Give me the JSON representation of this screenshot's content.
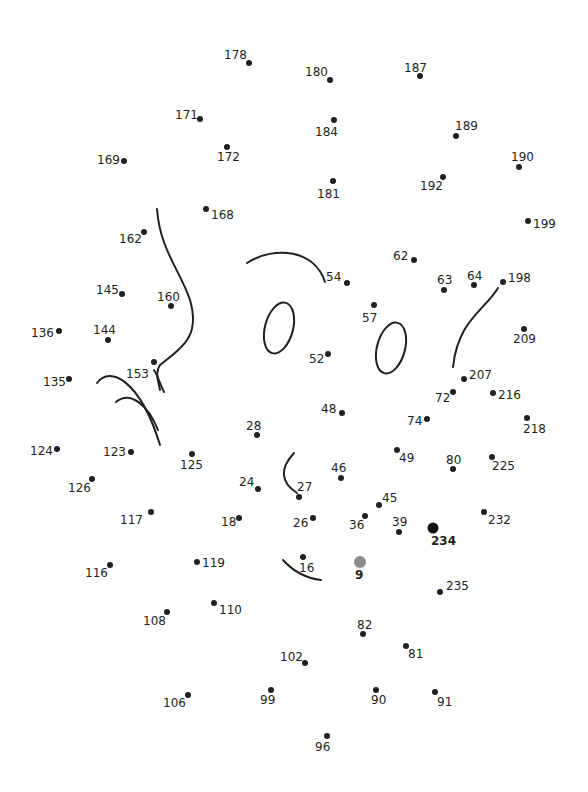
{
  "puzzle": {
    "type": "connect-the-dots",
    "colors": {
      "dot": "#231f20",
      "start_dot": "#8c8c8c",
      "end_dot": "#111111",
      "background": "#ffffff"
    },
    "start_number": "9",
    "end_number": "234",
    "dots": [
      {
        "n": "178",
        "x": 249,
        "y": 63,
        "lx": 224,
        "ly": 49
      },
      {
        "n": "180",
        "x": 330,
        "y": 80,
        "lx": 305,
        "ly": 66
      },
      {
        "n": "187",
        "x": 420,
        "y": 76,
        "lx": 404,
        "ly": 62
      },
      {
        "n": "171",
        "x": 200,
        "y": 119,
        "lx": 175,
        "ly": 109
      },
      {
        "n": "184",
        "x": 334,
        "y": 120,
        "lx": 315,
        "ly": 126
      },
      {
        "n": "189",
        "x": 456,
        "y": 136,
        "lx": 455,
        "ly": 120
      },
      {
        "n": "172",
        "x": 227,
        "y": 147,
        "lx": 217,
        "ly": 151
      },
      {
        "n": "169",
        "x": 124,
        "y": 161,
        "lx": 97,
        "ly": 154
      },
      {
        "n": "190",
        "x": 519,
        "y": 167,
        "lx": 511,
        "ly": 151
      },
      {
        "n": "181",
        "x": 333,
        "y": 181,
        "lx": 317,
        "ly": 188
      },
      {
        "n": "192",
        "x": 443,
        "y": 177,
        "lx": 420,
        "ly": 180
      },
      {
        "n": "168",
        "x": 206,
        "y": 209,
        "lx": 211,
        "ly": 209
      },
      {
        "n": "199",
        "x": 528,
        "y": 221,
        "lx": 533,
        "ly": 218
      },
      {
        "n": "162",
        "x": 144,
        "y": 232,
        "lx": 119,
        "ly": 233
      },
      {
        "n": "62",
        "x": 414,
        "y": 260,
        "lx": 393,
        "ly": 250
      },
      {
        "n": "54",
        "x": 347,
        "y": 283,
        "lx": 326,
        "ly": 271
      },
      {
        "n": "63",
        "x": 444,
        "y": 290,
        "lx": 437,
        "ly": 274
      },
      {
        "n": "64",
        "x": 474,
        "y": 285,
        "lx": 467,
        "ly": 270
      },
      {
        "n": "198",
        "x": 503,
        "y": 282,
        "lx": 508,
        "ly": 272
      },
      {
        "n": "145",
        "x": 122,
        "y": 294,
        "lx": 96,
        "ly": 284
      },
      {
        "n": "160",
        "x": 171,
        "y": 306,
        "lx": 157,
        "ly": 291
      },
      {
        "n": "57",
        "x": 374,
        "y": 305,
        "lx": 362,
        "ly": 312
      },
      {
        "n": "136",
        "x": 59,
        "y": 331,
        "lx": 31,
        "ly": 327
      },
      {
        "n": "144",
        "x": 108,
        "y": 340,
        "lx": 93,
        "ly": 324
      },
      {
        "n": "209",
        "x": 524,
        "y": 329,
        "lx": 513,
        "ly": 333
      },
      {
        "n": "52",
        "x": 328,
        "y": 354,
        "lx": 309,
        "ly": 353
      },
      {
        "n": "153",
        "x": 154,
        "y": 362,
        "lx": 126,
        "ly": 368
      },
      {
        "n": "135",
        "x": 69,
        "y": 379,
        "lx": 43,
        "ly": 376
      },
      {
        "n": "207",
        "x": 464,
        "y": 379,
        "lx": 469,
        "ly": 369
      },
      {
        "n": "72",
        "x": 453,
        "y": 392,
        "lx": 435,
        "ly": 392
      },
      {
        "n": "216",
        "x": 493,
        "y": 393,
        "lx": 498,
        "ly": 389
      },
      {
        "n": "48",
        "x": 342,
        "y": 413,
        "lx": 321,
        "ly": 403
      },
      {
        "n": "74",
        "x": 427,
        "y": 419,
        "lx": 407,
        "ly": 415
      },
      {
        "n": "218",
        "x": 527,
        "y": 418,
        "lx": 523,
        "ly": 423
      },
      {
        "n": "28",
        "x": 257,
        "y": 435,
        "lx": 246,
        "ly": 420
      },
      {
        "n": "124",
        "x": 57,
        "y": 449,
        "lx": 30,
        "ly": 445
      },
      {
        "n": "123",
        "x": 131,
        "y": 452,
        "lx": 103,
        "ly": 446
      },
      {
        "n": "125",
        "x": 192,
        "y": 454,
        "lx": 180,
        "ly": 459
      },
      {
        "n": "49",
        "x": 397,
        "y": 450,
        "lx": 399,
        "ly": 452
      },
      {
        "n": "80",
        "x": 453,
        "y": 469,
        "lx": 446,
        "ly": 454
      },
      {
        "n": "225",
        "x": 492,
        "y": 457,
        "lx": 492,
        "ly": 460
      },
      {
        "n": "46",
        "x": 341,
        "y": 478,
        "lx": 331,
        "ly": 462
      },
      {
        "n": "126",
        "x": 92,
        "y": 479,
        "lx": 68,
        "ly": 482
      },
      {
        "n": "24",
        "x": 258,
        "y": 489,
        "lx": 239,
        "ly": 476
      },
      {
        "n": "27",
        "x": 299,
        "y": 497,
        "lx": 297,
        "ly": 481
      },
      {
        "n": "45",
        "x": 379,
        "y": 505,
        "lx": 382,
        "ly": 492
      },
      {
        "n": "117",
        "x": 151,
        "y": 512,
        "lx": 120,
        "ly": 514
      },
      {
        "n": "18",
        "x": 239,
        "y": 518,
        "lx": 221,
        "ly": 516
      },
      {
        "n": "26",
        "x": 313,
        "y": 518,
        "lx": 293,
        "ly": 517
      },
      {
        "n": "36",
        "x": 365,
        "y": 516,
        "lx": 349,
        "ly": 519
      },
      {
        "n": "39",
        "x": 399,
        "y": 532,
        "lx": 392,
        "ly": 516
      },
      {
        "n": "232",
        "x": 484,
        "y": 512,
        "lx": 488,
        "ly": 514
      },
      {
        "n": "234",
        "x": 433,
        "y": 528,
        "lx": 431,
        "ly": 535,
        "style": "end"
      },
      {
        "n": "16",
        "x": 303,
        "y": 557,
        "lx": 299,
        "ly": 562
      },
      {
        "n": "9",
        "x": 360,
        "y": 562,
        "lx": 355,
        "ly": 569,
        "style": "start"
      },
      {
        "n": "119",
        "x": 197,
        "y": 562,
        "lx": 202,
        "ly": 557
      },
      {
        "n": "116",
        "x": 110,
        "y": 565,
        "lx": 85,
        "ly": 567
      },
      {
        "n": "235",
        "x": 440,
        "y": 592,
        "lx": 446,
        "ly": 580
      },
      {
        "n": "108",
        "x": 167,
        "y": 612,
        "lx": 143,
        "ly": 615
      },
      {
        "n": "110",
        "x": 214,
        "y": 603,
        "lx": 219,
        "ly": 604
      },
      {
        "n": "82",
        "x": 363,
        "y": 634,
        "lx": 357,
        "ly": 619
      },
      {
        "n": "81",
        "x": 406,
        "y": 646,
        "lx": 408,
        "ly": 648
      },
      {
        "n": "102",
        "x": 305,
        "y": 663,
        "lx": 280,
        "ly": 651
      },
      {
        "n": "106",
        "x": 188,
        "y": 695,
        "lx": 163,
        "ly": 697
      },
      {
        "n": "99",
        "x": 271,
        "y": 690,
        "lx": 260,
        "ly": 694
      },
      {
        "n": "90",
        "x": 376,
        "y": 690,
        "lx": 371,
        "ly": 694
      },
      {
        "n": "91",
        "x": 435,
        "y": 692,
        "lx": 437,
        "ly": 696
      },
      {
        "n": "96",
        "x": 327,
        "y": 736,
        "lx": 315,
        "ly": 741
      }
    ]
  }
}
